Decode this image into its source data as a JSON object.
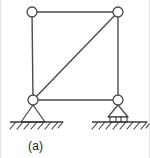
{
  "figure": {
    "caption": "(a)",
    "colors": {
      "member": "#4a4a52",
      "joint_stroke": "#4a4a52",
      "joint_fill": "#ffffff",
      "ground": "#3a3a40",
      "hatch": "#3a3a40",
      "caption": "#1b1b1b",
      "background": "#ffffff",
      "frame_border": "#d8d8d8"
    },
    "geometry": {
      "top_left_joint": {
        "x": 32,
        "y": 12,
        "r": 5
      },
      "top_right_joint": {
        "x": 118,
        "y": 12,
        "r": 5
      },
      "bottom_left_joint": {
        "x": 33,
        "y": 100,
        "r": 5
      },
      "bottom_right_joint": {
        "x": 118,
        "y": 100,
        "r": 5
      }
    },
    "members": [
      {
        "name": "top-chord",
        "from": "top_left_joint",
        "to": "top_right_joint"
      },
      {
        "name": "left-column",
        "from": "top_left_joint",
        "to": "bottom_left_joint"
      },
      {
        "name": "right-column",
        "from": "top_right_joint",
        "to": "bottom_right_joint"
      },
      {
        "name": "bottom-chord",
        "from": "bottom_left_joint",
        "to": "bottom_right_joint"
      },
      {
        "name": "diagonal-brace",
        "from": "bottom_left_joint",
        "to": "top_right_joint"
      }
    ],
    "joints": [
      {
        "name": "joint-top-left",
        "type": "pin-circle"
      },
      {
        "name": "joint-top-right",
        "type": "pin-circle"
      },
      {
        "name": "joint-bottom-left",
        "type": "pin-circle"
      },
      {
        "name": "joint-bottom-right",
        "type": "pin-circle"
      }
    ],
    "supports": [
      {
        "name": "pin-support",
        "type": "pinned",
        "label": "pin support",
        "apex": {
          "x": 33,
          "y": 105
        },
        "base_y": 122,
        "half_width": 12,
        "ground_x1": 10,
        "ground_x2": 63,
        "has_rollers": false
      },
      {
        "name": "roller-support",
        "type": "roller",
        "label": "roller support",
        "apex": {
          "x": 118,
          "y": 105
        },
        "base_y": 117,
        "half_width": 10,
        "ground_x1": 92,
        "ground_x2": 147,
        "has_rollers": true,
        "roller_count": 3
      }
    ],
    "ground_hatching": {
      "direction": "up-to-the-right",
      "angle_label": "45deg",
      "left_hatch_count": 8,
      "right_hatch_count": 9
    }
  }
}
